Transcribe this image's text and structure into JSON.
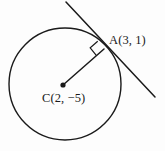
{
  "figure": {
    "type": "geometry-diagram",
    "background_color": "#fdfdfd",
    "stroke_color": "#1a1a1a",
    "labels": {
      "point_a": "A(3, 1)",
      "point_c": "C(2, −5)"
    },
    "points": {
      "center": {
        "name": "C",
        "x": 2,
        "y": -5,
        "px": 63,
        "py": 85
      },
      "tangent_point": {
        "name": "A",
        "x": 3,
        "y": 1,
        "px": 104,
        "py": 49
      }
    },
    "circle": {
      "cx": 65,
      "cy": 84,
      "r": 56
    },
    "tangent_line": {
      "x1": 66,
      "y1": 2,
      "x2": 155,
      "y2": 97
    },
    "radius_line": {
      "x1": 63,
      "y1": 85,
      "x2": 104,
      "y2": 49
    },
    "right_angle_marker": {
      "size": 10,
      "present": true
    }
  }
}
